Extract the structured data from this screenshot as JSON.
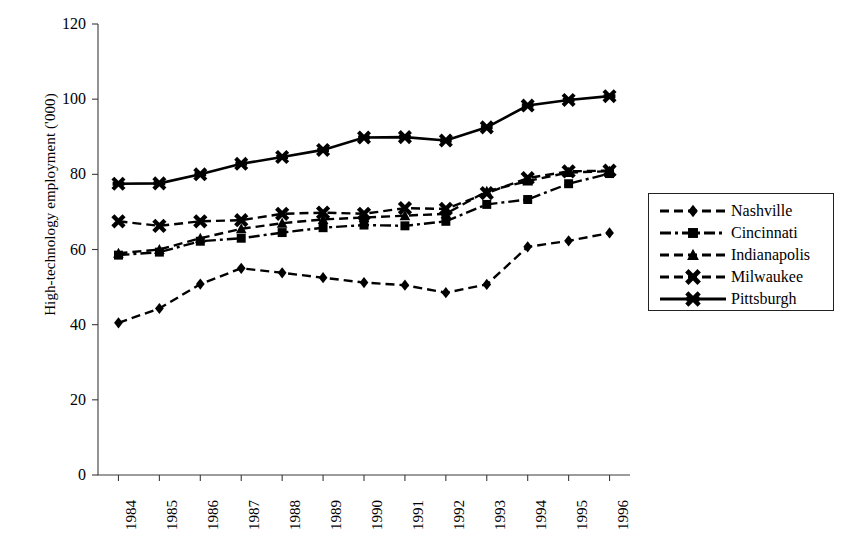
{
  "chart_data": {
    "type": "line",
    "title": "",
    "xlabel": "",
    "ylabel": "High-technology employment ('000)",
    "categories": [
      "1984",
      "1985",
      "1986",
      "1987",
      "1988",
      "1989",
      "1990",
      "1991",
      "1992",
      "1993",
      "1994",
      "1995",
      "1996"
    ],
    "x": [
      1984,
      1985,
      1986,
      1987,
      1988,
      1989,
      1990,
      1991,
      1992,
      1993,
      1994,
      1995,
      1996
    ],
    "ylim": [
      0,
      120
    ],
    "yticks": [
      0,
      20,
      40,
      60,
      80,
      100,
      120
    ],
    "grid": false,
    "legend_position": "right-outside",
    "series": [
      {
        "name": "Nashville",
        "marker": "diamond",
        "line_style": "dashed",
        "values": [
          40.5,
          44.3,
          50.8,
          55.0,
          53.8,
          52.5,
          51.2,
          50.5,
          48.5,
          50.7,
          60.7,
          62.3,
          64.4
        ]
      },
      {
        "name": "Cincinnati",
        "marker": "square",
        "line_style": "dash-dot",
        "values": [
          58.5,
          59.3,
          62.2,
          63.0,
          64.5,
          65.8,
          66.5,
          66.3,
          67.5,
          72.0,
          73.3,
          77.5,
          80.2
        ]
      },
      {
        "name": "Indianapolis",
        "marker": "triangle",
        "line_style": "dashed",
        "values": [
          59.0,
          60.0,
          63.0,
          65.5,
          67.0,
          68.0,
          68.5,
          69.0,
          69.5,
          75.5,
          78.2,
          80.5,
          80.8
        ]
      },
      {
        "name": "Milwaukee",
        "marker": "x",
        "line_style": "dashed",
        "values": [
          67.5,
          66.3,
          67.5,
          67.8,
          69.5,
          69.8,
          69.5,
          71.0,
          70.8,
          75.0,
          79.0,
          80.8,
          81.0
        ]
      },
      {
        "name": "Pittsburgh",
        "marker": "asterisk",
        "line_style": "solid",
        "values": [
          77.5,
          77.6,
          80.0,
          82.8,
          84.6,
          86.5,
          89.8,
          89.9,
          89.0,
          92.5,
          98.3,
          99.8,
          100.8
        ]
      }
    ]
  },
  "axes": {
    "y_tick_labels": [
      "120",
      "100",
      "80",
      "60",
      "40",
      "20",
      "0"
    ],
    "y_axis_title": "High-technology employment ('000)",
    "x_tick_labels": [
      "1984",
      "1985",
      "1986",
      "1987",
      "1988",
      "1989",
      "1990",
      "1991",
      "1992",
      "1993",
      "1994",
      "1995",
      "1996"
    ]
  },
  "legend": {
    "entries": [
      {
        "label": "Nashville",
        "marker": "diamond-marker",
        "line": "dashed"
      },
      {
        "label": "Cincinnati",
        "marker": "square-marker",
        "line": "dash-dot"
      },
      {
        "label": "Indianapolis",
        "marker": "triangle-marker",
        "line": "dashed"
      },
      {
        "label": "Milwaukee",
        "marker": "x-marker",
        "line": "dashed"
      },
      {
        "label": "Pittsburgh",
        "marker": "asterisk-marker",
        "line": "solid"
      }
    ]
  },
  "style": {
    "line_color": "#000000",
    "axis_color": "#3a3a3a",
    "background": "#ffffff"
  }
}
